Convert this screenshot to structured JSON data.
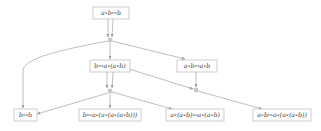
{
  "diagram": {
    "type": "multiway-rewrite-graph",
    "colors": {
      "edge": "#a8a8a8",
      "node_border": "#b8b8b8",
      "junction": "#c8c8c8",
      "text": "#3a3a3a"
    },
    "nodes": [
      {
        "id": "n0",
        "label": "a∘b↔b"
      },
      {
        "id": "n1",
        "label": "b↔a∘(a∘b)"
      },
      {
        "id": "n2",
        "label": "a∘b↔a∘b"
      },
      {
        "id": "n3",
        "label": "b↔b"
      },
      {
        "id": "n4",
        "label": "b↔a∘(a∘(a∘(a∘b)))"
      },
      {
        "id": "n5",
        "label": "a∘(a∘b)↔a∘(a∘b)"
      },
      {
        "id": "n6",
        "label": "a∘b↔a∘(a∘(a∘b))"
      }
    ],
    "junctions": [
      {
        "id": "j0",
        "inputs": [
          "n0",
          "n0"
        ],
        "outputs": [
          "n1",
          "n2",
          "n3"
        ]
      },
      {
        "id": "j1",
        "inputs": [
          "n1",
          "n1"
        ],
        "outputs": [
          "n3",
          "n4",
          "n5"
        ]
      },
      {
        "id": "j2",
        "inputs": [
          "n2",
          "n1"
        ],
        "outputs": [
          "n6"
        ]
      }
    ]
  }
}
